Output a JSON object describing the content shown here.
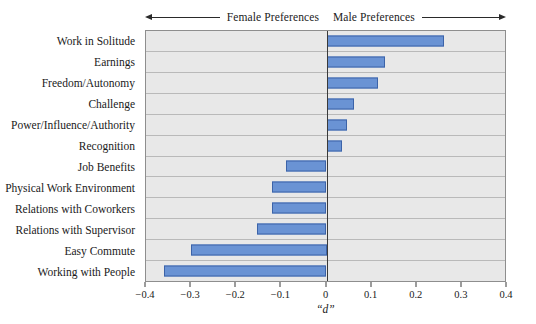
{
  "header": {
    "female_label": "Female Preferences",
    "male_label": "Male Preferences",
    "left_arrow_icon": "arrow-left-icon",
    "right_arrow_icon": "arrow-right-icon"
  },
  "axis": {
    "title": "“d”",
    "tick_labels": [
      "−0.4",
      "−0.3",
      "−0.2",
      "−0.1",
      "0",
      "0.1",
      "0.2",
      "0.3",
      "0.4"
    ]
  },
  "colors": {
    "bar_fill": "#6a93d4",
    "bar_stroke": "#3c63a8",
    "plot_background": "#e8e8e8",
    "gridline": "#b9b9b9",
    "frame": "#8e8e8e",
    "axis": "#3a3a3a"
  },
  "chart_data": {
    "type": "bar",
    "orientation": "horizontal",
    "title": "",
    "subtitle": "",
    "xlabel": "“d”",
    "ylabel": "",
    "xlim": [
      -0.4,
      0.4
    ],
    "xticks": [
      -0.4,
      -0.3,
      -0.2,
      -0.1,
      0,
      0.1,
      0.2,
      0.3,
      0.4
    ],
    "grid": true,
    "legend": "none",
    "annotations": [
      "Female Preferences",
      "Male Preferences"
    ],
    "categories": [
      "Work in Solitude",
      "Earnings",
      "Freedom/Autonomy",
      "Challenge",
      "Power/Influence/Authority",
      "Recognition",
      "Job Benefits",
      "Physical Work Environment",
      "Relations with Coworkers",
      "Relations with Supervisor",
      "Easy Commute",
      "Working with People"
    ],
    "values": [
      0.26,
      0.13,
      0.115,
      0.06,
      0.045,
      0.035,
      -0.09,
      -0.12,
      -0.12,
      -0.155,
      -0.3,
      -0.36
    ]
  }
}
